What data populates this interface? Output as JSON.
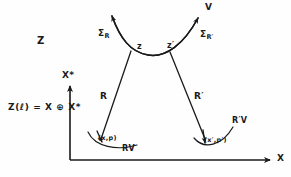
{
  "figure": {
    "background_color": "#fefefe",
    "ink_color": "#1a1a1a"
  },
  "axes": {
    "x_axis_label": "X",
    "y_axis_label": "X*",
    "origin": {
      "x": 70,
      "y": 160
    }
  },
  "labels": {
    "space_z": "Z",
    "equation": "Z(ℓ)  =  X ⊕ X*",
    "top_curve_v": "V",
    "sigma_r": "Σ",
    "sigma_r_sub": "R",
    "sigma_rprime": "Σ",
    "sigma_rprime_sub": "R′",
    "point_z": "z",
    "point_zprime": "z′",
    "section_r": "R",
    "section_rprime": "R′",
    "fibre_rv": "RV",
    "fibre_rprime_v": "R′V",
    "base_point": "(x,p)",
    "base_point_prime": "(x′,p′)"
  },
  "geometry": {
    "top_curve": "M 112,16 C 120,38 130,52 148,55 C 166,58 184,44 198,18",
    "left_leg": "M 131,51 L 101,139",
    "right_leg": "M 170,52 L 205,138",
    "left_fibre_arc": "M 92,136 C 100,148 118,150 135,146",
    "right_fibre_arc": "M 200,140 C 209,149 224,144 233,129",
    "x_axis": "M 70,160 L 272,160",
    "y_axis": "M 70,160 L 70,83"
  },
  "arrowheads": [
    {
      "name": "sigma-r-arrowhead",
      "x": 112,
      "y": 16
    },
    {
      "name": "sigma-rprime-arrowhead",
      "x": 198,
      "y": 18
    },
    {
      "name": "rv-arrowhead",
      "x": 95,
      "y": 140
    },
    {
      "name": "rprime-v-arrowhead",
      "x": 203,
      "y": 143
    },
    {
      "name": "x-axis-arrowhead",
      "x": 272,
      "y": 160
    },
    {
      "name": "y-axis-arrowhead",
      "x": 70,
      "y": 83
    }
  ]
}
